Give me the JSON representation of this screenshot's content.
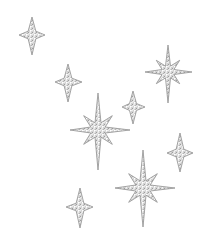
{
  "image": {
    "description": "Scattered silver glitter sparkle stars on white background",
    "background": "#ffffff",
    "colors": {
      "outline": "#9a9a9a",
      "fill_light": "#eeeeee",
      "fill_mid": "#cfcfcf",
      "fill_dark": "#a8a8a8"
    }
  },
  "stars": [
    {
      "id": "star-a",
      "type": "four-point",
      "cx": 32,
      "cy": 35,
      "top": 17,
      "bottom": 55,
      "left": 19,
      "right": 45
    },
    {
      "id": "star-b",
      "type": "four-point",
      "cx": 68,
      "cy": 82,
      "top": 64,
      "bottom": 102,
      "left": 55,
      "right": 82
    },
    {
      "id": "star-c",
      "type": "eight-point",
      "cx": 98,
      "cy": 130,
      "top": 93,
      "bottom": 170,
      "left": 70,
      "right": 130
    },
    {
      "id": "star-d",
      "type": "four-point",
      "cx": 133,
      "cy": 107,
      "top": 91,
      "bottom": 124,
      "left": 122,
      "right": 145
    },
    {
      "id": "star-e",
      "type": "eight-point",
      "cx": 168,
      "cy": 72,
      "top": 45,
      "bottom": 103,
      "left": 145,
      "right": 192
    },
    {
      "id": "star-f",
      "type": "four-point",
      "cx": 180,
      "cy": 153,
      "top": 133,
      "bottom": 172,
      "left": 167,
      "right": 193
    },
    {
      "id": "star-g",
      "type": "eight-point",
      "cx": 143,
      "cy": 188,
      "top": 150,
      "bottom": 227,
      "left": 115,
      "right": 175
    },
    {
      "id": "star-h",
      "type": "four-point",
      "cx": 80,
      "cy": 207,
      "top": 188,
      "bottom": 228,
      "left": 66,
      "right": 93
    }
  ]
}
